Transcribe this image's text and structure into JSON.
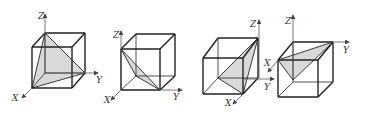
{
  "figure": {
    "colors": {
      "line": "#222222",
      "fill": "#d9d9d9",
      "axis": "#555555",
      "background": "#ffffff"
    },
    "cubes": [
      {
        "id": 1,
        "labels": {
          "z": "Z",
          "y": "Y",
          "x": "X"
        },
        "vertices": {
          "btl": [
            45,
            33
          ],
          "btr": [
            85,
            33
          ],
          "bbr": [
            85,
            73
          ],
          "bbl": [
            45,
            73
          ],
          "ftl": [
            32,
            47
          ],
          "ftr": [
            72,
            47
          ],
          "fbr": [
            72,
            88
          ],
          "fbl": [
            32,
            88
          ]
        },
        "section": [
          [
            45,
            33
          ],
          [
            32,
            88
          ],
          [
            85,
            73
          ]
        ],
        "axes": {
          "z": [
            [
              45,
              73
            ],
            [
              45,
              14
            ]
          ],
          "y": [
            [
              45,
              73
            ],
            [
              98,
              73
            ]
          ],
          "x": [
            [
              32,
              88
            ],
            [
              22,
              98
            ]
          ]
        },
        "label_pos": {
          "z": [
            38,
            19
          ],
          "y": [
            96,
            83
          ],
          "x": [
            12,
            101
          ]
        }
      },
      {
        "id": 2,
        "labels": {
          "z": "Z",
          "y": "Y",
          "x": "X"
        },
        "vertices": {
          "btl": [
            136,
            34
          ],
          "btr": [
            175,
            34
          ],
          "bbr": [
            175,
            76
          ],
          "bbl": [
            136,
            76
          ],
          "ftl": [
            121,
            49
          ],
          "ftr": [
            160,
            49
          ],
          "fbr": [
            160,
            90
          ],
          "fbl": [
            121,
            90
          ]
        },
        "section": [
          [
            121,
            49
          ],
          [
            136,
            76
          ],
          [
            160,
            90
          ]
        ],
        "axes": {
          "z": [
            [
              121,
              90
            ],
            [
              121,
              31
            ]
          ],
          "y": [
            [
              121,
              90
            ],
            [
              182,
              90
            ]
          ],
          "x": [
            [
              121,
              90
            ],
            [
              111,
              100
            ]
          ]
        },
        "label_pos": {
          "z": [
            113,
            38
          ],
          "y": [
            173,
            100
          ],
          "x": [
            104,
            103
          ]
        }
      },
      {
        "id": 3,
        "labels": {
          "z": "Z",
          "y": "Y",
          "x": "X"
        },
        "vertices": {
          "btl": [
            218,
            38
          ],
          "btr": [
            258,
            38
          ],
          "bbr": [
            258,
            78
          ],
          "bbl": [
            218,
            78
          ],
          "ftl": [
            203,
            58
          ],
          "ftr": [
            243,
            58
          ],
          "fbr": [
            243,
            94
          ],
          "fbl": [
            203,
            94
          ]
        },
        "section": [
          [
            258,
            38
          ],
          [
            218,
            78
          ],
          [
            243,
            94
          ]
        ],
        "axes": {
          "z": [
            [
              259,
              78
            ],
            [
              259,
              20
            ]
          ],
          "y": [
            [
              243,
              79
            ],
            [
              274,
              79
            ]
          ],
          "x": [
            [
              243,
              94
            ],
            [
              233,
              104
            ]
          ]
        },
        "label_pos": {
          "z": [
            250,
            27
          ],
          "y": [
            264,
            90
          ],
          "x": [
            225,
            106
          ]
        }
      },
      {
        "id": 4,
        "labels": {
          "z": "Z",
          "y": "Y",
          "x": "X"
        },
        "vertices": {
          "btl": [
            293,
            42
          ],
          "btr": [
            333,
            42
          ],
          "bbr": [
            333,
            82
          ],
          "bbl": [
            293,
            82
          ],
          "ftl": [
            278,
            60
          ],
          "ftr": [
            318,
            60
          ],
          "fbr": [
            318,
            97
          ],
          "fbl": [
            278,
            97
          ]
        },
        "section": [
          [
            278,
            60
          ],
          [
            333,
            42
          ],
          [
            293,
            80
          ]
        ],
        "axes": {
          "z": [
            [
              293,
              80
            ],
            [
              293,
              15
            ]
          ],
          "y": [
            [
              293,
              42
            ],
            [
              349,
              42
            ]
          ],
          "x": [
            [
              278,
              60
            ],
            [
              268,
              72
            ]
          ]
        },
        "label_pos": {
          "z": [
            285,
            24
          ],
          "y": [
            343,
            53
          ],
          "x": [
            264,
            66
          ]
        }
      }
    ]
  }
}
